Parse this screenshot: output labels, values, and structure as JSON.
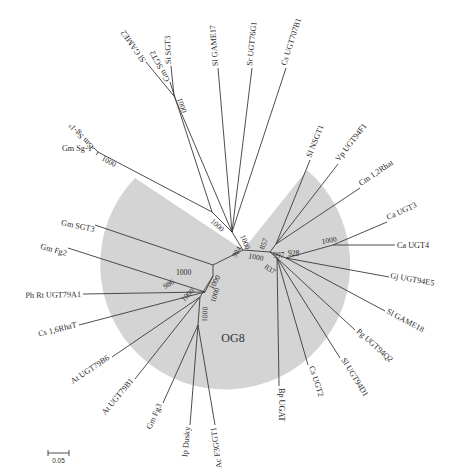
{
  "diagram": {
    "type": "unrooted phylogenetic tree",
    "shaded_clade": {
      "label": "OG8",
      "color": "#d4d4d4"
    },
    "scale_bar": {
      "label": "0.05"
    },
    "leaves": [
      {
        "id": "sl_game2",
        "label": "Sl GAME2"
      },
      {
        "id": "st_sgt3",
        "label": "St SGT3"
      },
      {
        "id": "sl_game17",
        "label": "Sl GAME17"
      },
      {
        "id": "sr_ugt76g1",
        "label": "Sr UGT76G1"
      },
      {
        "id": "cs_ugt707b1",
        "label": "Cs UGT707B1"
      },
      {
        "id": "gm_sgt2",
        "label": "Gm SGT2"
      },
      {
        "id": "gm_sg1b",
        "label": "Gm Sg-1ᵇ"
      },
      {
        "id": "gm_sg1a",
        "label": "Gm Sg-1ᵃ"
      },
      {
        "id": "sl_nsgt1",
        "label": "Sl NSGT1"
      },
      {
        "id": "vp_ugt94f1",
        "label": "Vp UGT94F1"
      },
      {
        "id": "cm_12rhat",
        "label": "Cm 1,2Rhat"
      },
      {
        "id": "ca_ugt3",
        "label": "Ca UGT3"
      },
      {
        "id": "ca_ugt4",
        "label": "Ca UGT4"
      },
      {
        "id": "gj_ugt94e5",
        "label": "Gj UGT94E5"
      },
      {
        "id": "sl_game18",
        "label": "Sl GAME18"
      },
      {
        "id": "pg_ugt94q2",
        "label": "Pg UGT94Q2"
      },
      {
        "id": "sl_ugt94d1",
        "label": "Sl UGT94D1"
      },
      {
        "id": "cs_ugt2",
        "label": "Cs UGT2"
      },
      {
        "id": "bp_ugat",
        "label": "Bp UGAT"
      },
      {
        "id": "ac_f3gggt1",
        "label": "Ac F3GGT1"
      },
      {
        "id": "ip_dusky",
        "label": "Ip Dusky"
      },
      {
        "id": "gm_fg3",
        "label": "Gm Fg3"
      },
      {
        "id": "at_ugt79b1",
        "label": "At UGT79B1"
      },
      {
        "id": "at_ugt79b6",
        "label": "At UGT79B6"
      },
      {
        "id": "cs_16rhat",
        "label": "Cs 1,6RhaT"
      },
      {
        "id": "ph_rt_ugt79a1",
        "label": "Ph Rt UGT79A1"
      },
      {
        "id": "gm_fg2",
        "label": "Gm Fg2"
      },
      {
        "id": "gm_sgt3",
        "label": "Gm SGT3"
      }
    ],
    "bootstrap_values": [
      {
        "id": "b_st_game2",
        "value": "1000"
      },
      {
        "id": "b_gmsg1",
        "value": "1000"
      },
      {
        "id": "b_upper_left",
        "value": "1000"
      },
      {
        "id": "b_upper_center",
        "value": "1000"
      },
      {
        "id": "b_857",
        "value": "857"
      },
      {
        "id": "b_997",
        "value": "997"
      },
      {
        "id": "b_928",
        "value": "928"
      },
      {
        "id": "b_ca",
        "value": "1000"
      },
      {
        "id": "b_984",
        "value": "984"
      },
      {
        "id": "b_center_1000",
        "value": "1000"
      },
      {
        "id": "b_837",
        "value": "837"
      },
      {
        "id": "b_left_1000",
        "value": "1000"
      },
      {
        "id": "b_986",
        "value": "986"
      },
      {
        "id": "b_l2_1000",
        "value": "1000"
      },
      {
        "id": "b_l3_1000",
        "value": "1000"
      },
      {
        "id": "b_l4_1000",
        "value": "1000"
      },
      {
        "id": "b_l5_1000",
        "value": "1000"
      }
    ]
  }
}
